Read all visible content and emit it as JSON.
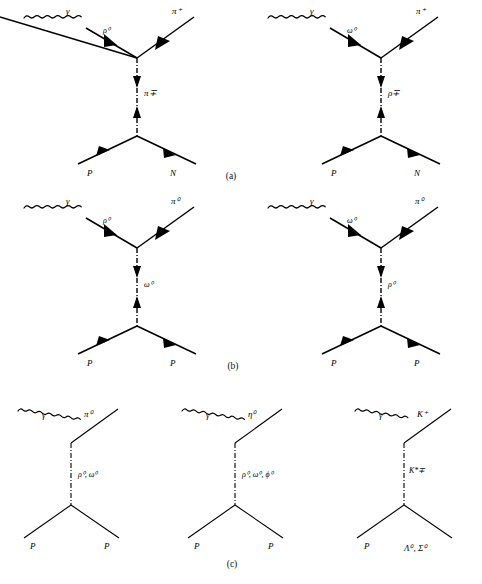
{
  "figure": {
    "background_color": "#ffffff",
    "line_color": "#000000",
    "rows": [
      {
        "caption": "(a)",
        "diagrams": [
          {
            "name": "gamma-p-to-piplus-n-rho0-vertex-pi-exchange",
            "incoming_boson": "γ",
            "vertex_boson": "ρ⁰",
            "outgoing_meson": "π⁺",
            "exchange": "π∓",
            "incoming_baryon": "P",
            "outgoing_baryon": "N"
          },
          {
            "name": "gamma-p-to-piplus-n-omega0-vertex-rho-exchange",
            "incoming_boson": "γ",
            "vertex_boson": "ω⁰",
            "outgoing_meson": "π⁺",
            "exchange": "ρ∓",
            "incoming_baryon": "P",
            "outgoing_baryon": "N"
          }
        ]
      },
      {
        "caption": "(b)",
        "diagrams": [
          {
            "name": "gamma-p-to-pi0-p-rho0-vertex-omega-exchange",
            "incoming_boson": "γ",
            "vertex_boson": "ρ⁰",
            "outgoing_meson": "π⁰",
            "exchange": "ω⁰",
            "incoming_baryon": "P",
            "outgoing_baryon": "P"
          },
          {
            "name": "gamma-p-to-pi0-p-omega0-vertex-rho-exchange",
            "incoming_boson": "γ",
            "vertex_boson": "ω⁰",
            "outgoing_meson": "π⁰",
            "exchange": "ρ⁰",
            "incoming_baryon": "P",
            "outgoing_baryon": "P"
          }
        ]
      },
      {
        "caption": "(c)",
        "diagrams": [
          {
            "name": "gamma-p-to-pi0-p-vector-exchange",
            "incoming_boson": "γ",
            "outgoing_meson": "π⁰",
            "exchange": "ρ⁰, ω⁰",
            "incoming_baryon": "P",
            "outgoing_baryon": "P"
          },
          {
            "name": "gamma-p-to-eta0-p-vector-exchange",
            "incoming_boson": "γ",
            "outgoing_meson": "η⁰",
            "exchange": "ρ⁰, ω⁰, ϕ⁰",
            "incoming_baryon": "P",
            "outgoing_baryon": "P"
          },
          {
            "name": "gamma-p-to-kplus-lambda-sigma-kstar-exchange",
            "incoming_boson": "γ",
            "outgoing_meson": "K⁺",
            "exchange": "K*∓",
            "incoming_baryon": "P",
            "outgoing_baryon": "Λ⁰, Σ⁰"
          }
        ]
      }
    ]
  }
}
